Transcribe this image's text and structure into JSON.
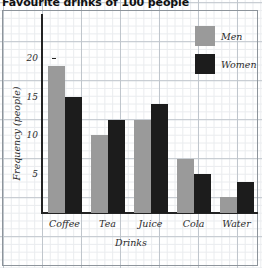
{
  "chart_data": {
    "type": "bar",
    "title": "Favourite drinks of 100 people",
    "xlabel": "Drinks",
    "ylabel": "Frequency (people)",
    "categories": [
      "Coffee",
      "Tea",
      "Juice",
      "Cola",
      "Water"
    ],
    "series": [
      {
        "name": "Men",
        "color": "#9a9a9a",
        "values": [
          19,
          10,
          12,
          7,
          2
        ]
      },
      {
        "name": "Women",
        "color": "#1c1c1c",
        "values": [
          15,
          12,
          14,
          5,
          4
        ]
      }
    ],
    "ylim": [
      0,
      25
    ],
    "yticks": [
      5,
      10,
      15,
      20
    ],
    "ytick_labels": [
      "5",
      "10",
      "15",
      "20"
    ],
    "grid": true,
    "grid_style": "graph-paper",
    "legend_position": "top-right"
  },
  "legend": {
    "items": [
      {
        "label": "Men",
        "swatch": "men"
      },
      {
        "label": "Women",
        "swatch": "women"
      }
    ]
  },
  "axes": {
    "y_title": "Frequency (people)",
    "x_title": "Drinks"
  }
}
